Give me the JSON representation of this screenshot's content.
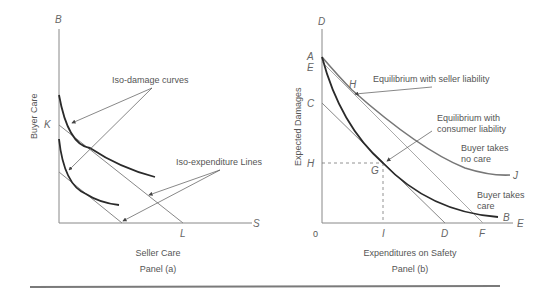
{
  "panel_a": {
    "caption": "Panel (a)",
    "x_axis_label": "Seller Care",
    "y_axis_label": "Buyer Care",
    "y_axis_end_label": "B",
    "x_axis_end_label": "S",
    "k_label": "K",
    "l_label": "L",
    "annotation_iso_damage": "Iso-damage curves",
    "annotation_iso_expenditure": "Iso-expenditure Lines"
  },
  "panel_b": {
    "caption": "Panel (b)",
    "x_axis_label": "Expenditures on Safety",
    "y_axis_label": "Expected Damages",
    "y_axis_end_label": "D",
    "x_axis_end_label": "E",
    "origin_label": "0",
    "y_labels": {
      "a": "A",
      "e": "E",
      "c": "C",
      "h": "H"
    },
    "x_labels": {
      "i": "I",
      "d": "D",
      "f": "F"
    },
    "point_labels": {
      "h": "H",
      "g": "G",
      "j": "J",
      "b": "B"
    },
    "annotation_seller": "Equilibrium with seller liability",
    "annotation_consumer_1": "Equilibrium with",
    "annotation_consumer_2": "consumer liability",
    "curve_no_care_1": "Buyer takes",
    "curve_no_care_2": "no care",
    "curve_care_1": "Buyer takes",
    "curve_care_2": "care"
  },
  "colors": {
    "axis": "#888888",
    "curve_dark": "#2a2a2a",
    "curve_gray": "#777777",
    "line_light": "#999999",
    "rule": "#7a7a7a"
  }
}
